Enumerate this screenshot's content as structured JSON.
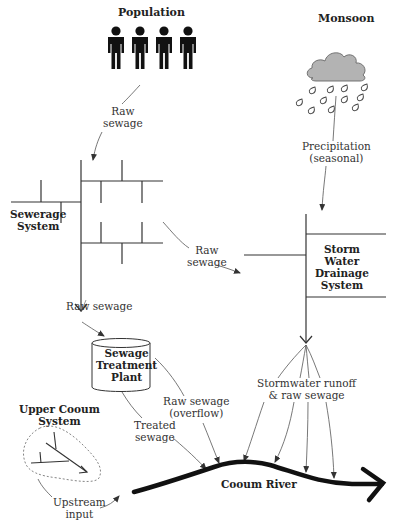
{
  "diagram": {
    "type": "flow-diagram",
    "nodes": {
      "population": {
        "label": "Population"
      },
      "monsoon": {
        "label": "Monsoon"
      },
      "sewerage": {
        "label_line1": "Sewerage",
        "label_line2": "System"
      },
      "storm": {
        "label_line1": "Storm",
        "label_line2": "Water",
        "label_line3": "Drainage",
        "label_line4": "System"
      },
      "stp": {
        "label_line1": "Sewage",
        "label_line2": "Treatment",
        "label_line3": "Plant"
      },
      "upper_cooum": {
        "label_line1": "Upper Cooum",
        "label_line2": "System"
      },
      "river": {
        "label": "Cooum River"
      }
    },
    "edges": {
      "pop_to_sewer": {
        "line1": "Raw",
        "line2": "sewage"
      },
      "monsoon_to_storm": {
        "line1": "Precipitation",
        "line2": "(seasonal)"
      },
      "sewer_to_storm": {
        "line1": "Raw",
        "line2": "sewage"
      },
      "sewer_to_stp": {
        "label": "Raw sewage"
      },
      "stp_overflow": {
        "line1": "Raw sewage",
        "line2": "(overflow)"
      },
      "stp_treated": {
        "line1": "Treated",
        "line2": "sewage"
      },
      "storm_runoff": {
        "line1": "Stormwater runoff",
        "line2": "& raw sewage"
      },
      "upstream": {
        "line1": "Upstream",
        "line2": "input"
      }
    },
    "colors": {
      "line": "#333333",
      "river": "#111111",
      "cloud_fill": "#b3b3b3",
      "figure": "#111111"
    }
  }
}
